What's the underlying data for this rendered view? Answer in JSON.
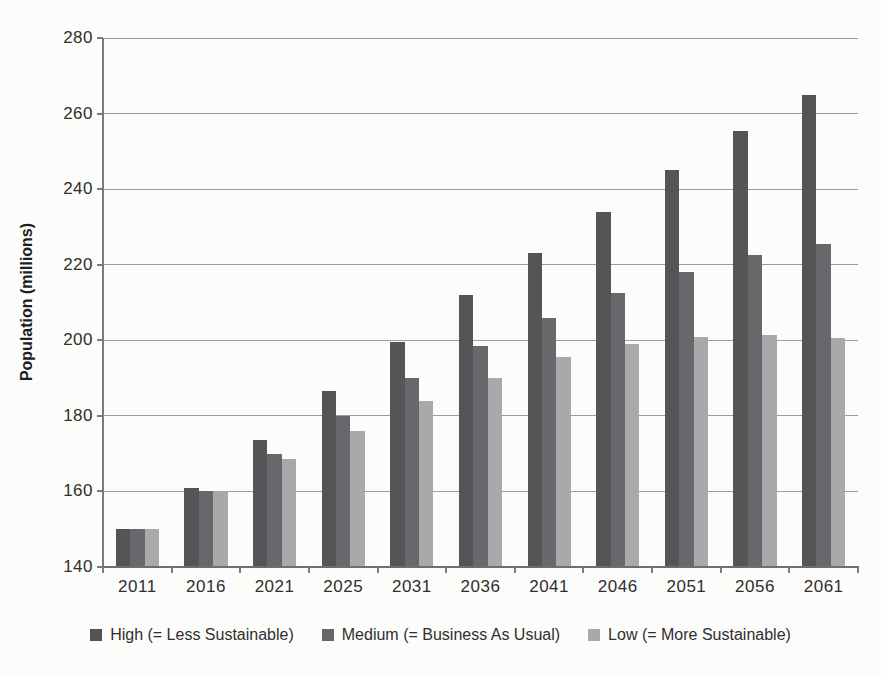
{
  "chart_data": {
    "type": "bar",
    "title": "",
    "xlabel": "",
    "ylabel": "Population (millions)",
    "ylim": [
      140,
      280
    ],
    "y_ticks": [
      280,
      260,
      240,
      220,
      200,
      180,
      160,
      140
    ],
    "grid": true,
    "legend_position": "bottom",
    "categories": [
      "2011",
      "2016",
      "2021",
      "2025",
      "2031",
      "2036",
      "2041",
      "2046",
      "2051",
      "2056",
      "2061"
    ],
    "series": [
      {
        "key": "high",
        "name": "High (= Less Sustainable)",
        "color": "#555558",
        "values": [
          150,
          161,
          173.5,
          186.5,
          199.5,
          212,
          223,
          234,
          245,
          255.5,
          265
        ]
      },
      {
        "key": "medium",
        "name": "Medium (= Business As Usual)",
        "color": "#67686b",
        "values": [
          150,
          160,
          170,
          180,
          190,
          198.5,
          206,
          212.5,
          218,
          222.5,
          225.5
        ]
      },
      {
        "key": "low",
        "name": "Low (= More Sustainable)",
        "color": "#a8a9ab",
        "values": [
          150,
          160,
          168.5,
          176,
          184,
          190,
          195.5,
          199,
          201,
          201.5,
          200.5
        ]
      }
    ]
  }
}
